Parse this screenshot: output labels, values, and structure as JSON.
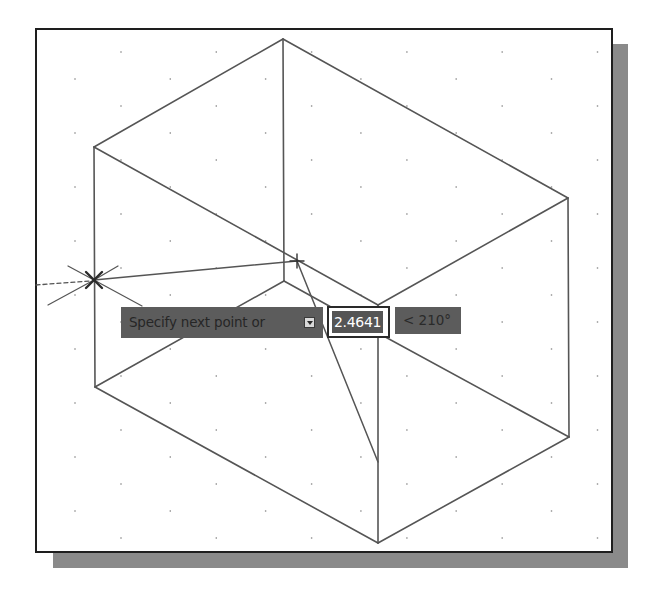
{
  "viewport": {
    "frame": {
      "x": 35,
      "y": 28,
      "w": 578,
      "h": 525
    },
    "shadow_right": {
      "x": 612,
      "y": 44,
      "w": 16,
      "h": 524
    },
    "shadow_bottom": {
      "x": 53,
      "y": 552,
      "w": 575,
      "h": 16
    },
    "colors": {
      "frame_border": "#1e1e1e",
      "shadow": "#8a8a8a",
      "line": "#555555",
      "grid_dot": "#8c8c8c",
      "tooltip_bg": "#5c5c5c"
    }
  },
  "grid": {
    "type": "isometric-dots",
    "x_start_even": 121,
    "x_start_odd": 75,
    "x_step": 95.3,
    "y_start": 52,
    "y_step": 27,
    "rows": 19,
    "x_min": 40,
    "x_max": 608,
    "y_max": 548
  },
  "drawing": {
    "object": "isometric box",
    "edges": [
      {
        "x1": 283,
        "y1": 39,
        "x2": 94,
        "y2": 147
      },
      {
        "x1": 283,
        "y1": 39,
        "x2": 568,
        "y2": 198
      },
      {
        "x1": 283,
        "y1": 39,
        "x2": 284,
        "y2": 281
      },
      {
        "x1": 94,
        "y1": 147,
        "x2": 378,
        "y2": 305
      },
      {
        "x1": 568,
        "y1": 198,
        "x2": 378,
        "y2": 305
      },
      {
        "x1": 94,
        "y1": 147,
        "x2": 95,
        "y2": 387
      },
      {
        "x1": 568,
        "y1": 198,
        "x2": 569,
        "y2": 437
      },
      {
        "x1": 378,
        "y1": 305,
        "x2": 378,
        "y2": 543
      },
      {
        "x1": 95,
        "y1": 387,
        "x2": 378,
        "y2": 543
      },
      {
        "x1": 569,
        "y1": 437,
        "x2": 378,
        "y2": 543
      },
      {
        "x1": 284,
        "y1": 281,
        "x2": 95,
        "y2": 387
      },
      {
        "x1": 284,
        "y1": 281,
        "x2": 378,
        "y2": 333
      },
      {
        "x1": 378,
        "y1": 333,
        "x2": 569,
        "y2": 437
      }
    ],
    "rubber_band": [
      {
        "x1": 94,
        "y1": 280,
        "x2": 297,
        "y2": 261
      },
      {
        "x1": 297,
        "y1": 261,
        "x2": 378,
        "y2": 462
      }
    ],
    "tracking_lines": [
      {
        "x1": 94,
        "y1": 280,
        "x2": 142,
        "y2": 306
      },
      {
        "x1": 94,
        "y1": 280,
        "x2": 118,
        "y2": 266
      },
      {
        "x1": 94,
        "y1": 280,
        "x2": 48,
        "y2": 305
      },
      {
        "x1": 94,
        "y1": 280,
        "x2": 68,
        "y2": 266
      }
    ],
    "dashed_line": {
      "x1": 36,
      "y1": 285,
      "x2": 90,
      "y2": 281
    },
    "snap_marker": {
      "x": 94,
      "y": 280,
      "size": 8,
      "symbol": "x-marker"
    },
    "cursor": {
      "x": 297,
      "y": 261,
      "size": 7,
      "symbol": "crosshair-cursor"
    }
  },
  "dynamic_input": {
    "prompt": {
      "label": "Specify next point or",
      "icon": "down-arrow-icon",
      "x": 121,
      "y": 307,
      "w": 202,
      "h": 31
    },
    "distance_input": {
      "value": "2.4641",
      "x": 327,
      "y": 306,
      "w": 63,
      "h": 32
    },
    "angle": {
      "value": "< 210°",
      "x": 395,
      "y": 307,
      "w": 66,
      "h": 27
    }
  }
}
